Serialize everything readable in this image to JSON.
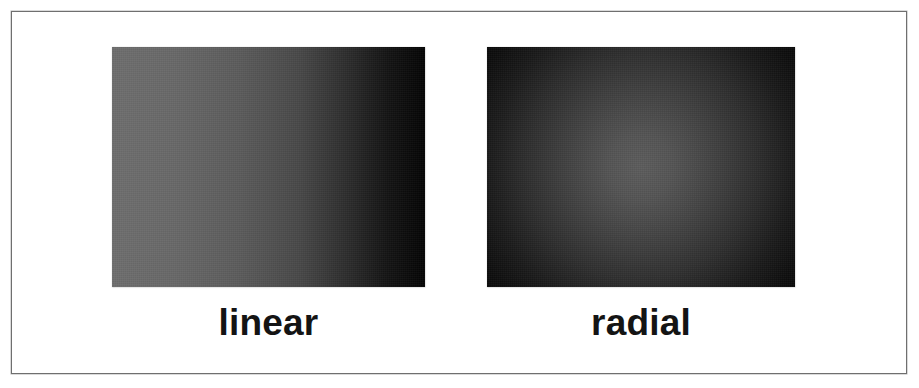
{
  "figure": {
    "background_color": "#ffffff",
    "frame": {
      "border_color": "#6f6f6f",
      "border_width_px": 1,
      "x": 11,
      "y": 11,
      "width": 896,
      "height": 363
    },
    "panels": [
      {
        "id": "linear",
        "caption": "linear",
        "gradient_type": "linear",
        "direction": "left-to-right",
        "start_color": "#6e6e6e",
        "end_color": "#050505",
        "x": 112,
        "y": 47,
        "width": 313,
        "height": 240
      },
      {
        "id": "radial",
        "caption": "radial",
        "gradient_type": "radial",
        "direction": "center-outward",
        "center_color": "#5c5c5c",
        "edge_color": "#050505",
        "center_x_pct": 50,
        "center_y_pct": 50,
        "x": 487,
        "y": 47,
        "width": 308,
        "height": 240
      }
    ],
    "caption_color": "#141414"
  },
  "chart_data": {
    "type": "heatmap",
    "title": "",
    "xlabel": "",
    "ylabel": "",
    "panels": [
      {
        "name": "linear",
        "type": "linear-gradient",
        "axis": "horizontal",
        "stops": [
          {
            "position_pct": 0,
            "gray_value": 110,
            "hex": "#6e6e6e"
          },
          {
            "position_pct": 20,
            "gray_value": 104,
            "hex": "#686868"
          },
          {
            "position_pct": 40,
            "gray_value": 92,
            "hex": "#5c5c5c"
          },
          {
            "position_pct": 60,
            "gray_value": 72,
            "hex": "#484848"
          },
          {
            "position_pct": 75,
            "gray_value": 45,
            "hex": "#2d2d2d"
          },
          {
            "position_pct": 88,
            "gray_value": 20,
            "hex": "#141414"
          },
          {
            "position_pct": 100,
            "gray_value": 5,
            "hex": "#050505"
          }
        ]
      },
      {
        "name": "radial",
        "type": "radial-gradient",
        "center_pct": [
          50,
          50
        ],
        "stops": [
          {
            "radius_pct": 0,
            "gray_value": 92,
            "hex": "#5c5c5c"
          },
          {
            "radius_pct": 15,
            "gray_value": 84,
            "hex": "#545454"
          },
          {
            "radius_pct": 30,
            "gray_value": 70,
            "hex": "#464646"
          },
          {
            "radius_pct": 50,
            "gray_value": 50,
            "hex": "#323232"
          },
          {
            "radius_pct": 70,
            "gray_value": 28,
            "hex": "#1c1c1c"
          },
          {
            "radius_pct": 85,
            "gray_value": 14,
            "hex": "#0e0e0e"
          },
          {
            "radius_pct": 100,
            "gray_value": 5,
            "hex": "#050505"
          }
        ]
      }
    ],
    "legend": [
      "linear",
      "radial"
    ],
    "grid": false
  }
}
